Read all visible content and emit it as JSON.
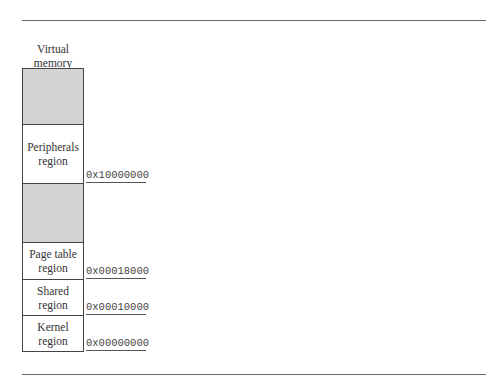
{
  "diagram": {
    "title": "Virtual memory",
    "title_lines": [
      "Virtual",
      "memory"
    ],
    "regions": [
      {
        "label": "",
        "shaded": true,
        "top": 0,
        "height": 56
      },
      {
        "label_lines": [
          "Peripherals",
          "region"
        ],
        "shaded": false,
        "top": 56,
        "height": 59
      },
      {
        "label": "",
        "shaded": true,
        "top": 115,
        "height": 59
      },
      {
        "label_lines": [
          "Page table",
          "region"
        ],
        "shaded": false,
        "top": 174,
        "height": 37
      },
      {
        "label_lines": [
          "Shared",
          "region"
        ],
        "shaded": false,
        "top": 211,
        "height": 36
      },
      {
        "label_lines": [
          "Kernel",
          "region"
        ],
        "shaded": false,
        "top": 247,
        "height": 36
      }
    ],
    "addresses": [
      {
        "value": "0x10000000",
        "boundary_y": 183
      },
      {
        "value": "0x00018000",
        "boundary_y": 279
      },
      {
        "value": "0x00010000",
        "boundary_y": 315
      },
      {
        "value": "0x00000000",
        "boundary_y": 351
      }
    ],
    "colors": {
      "shaded": "#d3d3d3",
      "border": "#444444",
      "rule": "#666666"
    }
  }
}
